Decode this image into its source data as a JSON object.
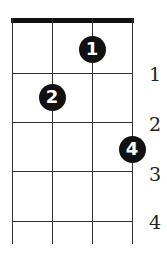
{
  "diagram": {
    "type": "chord-diagram",
    "strings": 4,
    "frets_shown": 4,
    "fret_labels": [
      "1",
      "2",
      "3",
      "4"
    ],
    "fingerings": [
      {
        "finger": "1",
        "string": 3,
        "fret": 1
      },
      {
        "finger": "2",
        "string": 2,
        "fret": 2
      },
      {
        "finger": "4",
        "string": 4,
        "fret": 3
      }
    ],
    "colors": {
      "line": "#333333",
      "nut": "#111111",
      "dot": "#111111",
      "dot_text": "#ffffff"
    }
  }
}
